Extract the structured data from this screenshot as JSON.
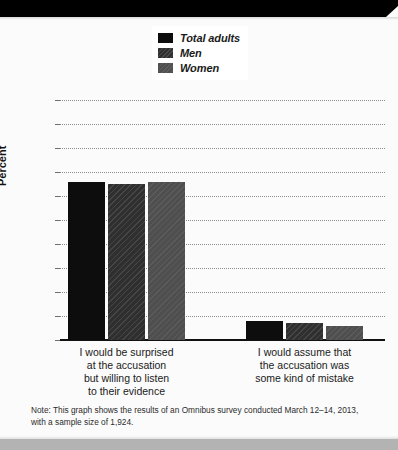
{
  "chart_data": {
    "type": "bar",
    "title": "",
    "xlabel": "",
    "ylabel": "Percent",
    "ylim": [
      0,
      100
    ],
    "ytick_step": 10,
    "yticks": [
      "100",
      "90",
      "80",
      "70",
      "60",
      "50",
      "40",
      "30",
      "20",
      "10",
      "0"
    ],
    "grid": true,
    "legend_position": "top-center",
    "categories": [
      "I would be surprised at the accusation but willing to listen to their evidence",
      "I would assume that the accusation was some kind of mistake"
    ],
    "category_lines": [
      [
        "I would be surprised",
        "at the accusation",
        "but willing to listen",
        "to their evidence"
      ],
      [
        "I would assume that",
        "the accusation was",
        "some kind of mistake"
      ]
    ],
    "series": [
      {
        "name": "Total adults",
        "color": "#0d0d0d",
        "values": [
          66,
          8
        ]
      },
      {
        "name": "Men",
        "color": "#2f2f2f",
        "values": [
          65,
          7
        ]
      },
      {
        "name": "Women",
        "color": "#4f4f4f",
        "values": [
          66,
          6
        ]
      }
    ],
    "note": "Note: This graph shows the results of an Omnibus survey conducted March 12–14, 2013, with a sample size of 1,924."
  },
  "legend": {
    "items": [
      {
        "label": "Total adults",
        "color": "#0d0d0d"
      },
      {
        "label": "Men",
        "color": "#2f2f2f"
      },
      {
        "label": "Women",
        "color": "#4f4f4f"
      }
    ]
  },
  "axis": {
    "y_title": "Percent",
    "y_ticks": [
      "100",
      "90",
      "80",
      "70",
      "60",
      "50",
      "40",
      "30",
      "20",
      "10",
      "0"
    ]
  },
  "footnote": {
    "text": "Note: This graph shows the results of an Omnibus survey conducted March 12–14, 2013, with a sample size of 1,924."
  }
}
